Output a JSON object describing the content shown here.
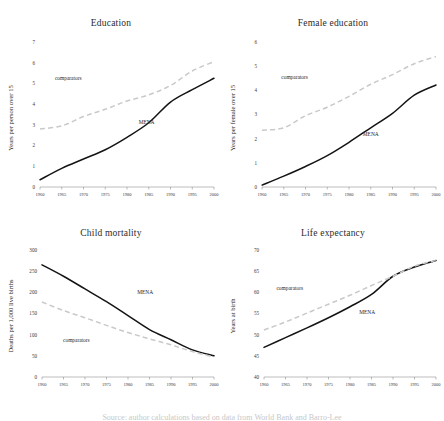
{
  "figure": {
    "background": "#ffffff",
    "mena_color": "#141414",
    "comparator_color": "#c9c9c9",
    "caption": "Source: author calculations based on data from World Bank and Barro-Lee"
  },
  "series_labels": {
    "mena": "MENA",
    "comparators": "comparators"
  },
  "chart_data": [
    {
      "type": "line",
      "title": "Education",
      "xlabel": "",
      "ylabel": "Years per person over 15",
      "x": [
        1960,
        1965,
        1970,
        1975,
        1980,
        1985,
        1990,
        1995,
        2000
      ],
      "xlim": [
        1960,
        2000
      ],
      "ylim": [
        0,
        7
      ],
      "yticks": [
        0,
        1,
        2,
        3,
        4,
        5,
        6,
        7
      ],
      "xticks": [
        "1960",
        "1965",
        "1970",
        "1975",
        "1980",
        "1985",
        "1990",
        "1995",
        "2000"
      ],
      "grid": false,
      "legend": "in-plot labels",
      "series": [
        {
          "name": "MENA",
          "values": [
            0.35,
            0.9,
            1.35,
            1.8,
            2.4,
            3.1,
            4.1,
            4.7,
            5.25
          ]
        },
        {
          "name": "comparators",
          "values": [
            2.8,
            2.95,
            3.4,
            3.75,
            4.15,
            4.45,
            4.9,
            5.6,
            6.05
          ]
        }
      ]
    },
    {
      "type": "line",
      "title": "Female education",
      "xlabel": "",
      "ylabel": "Years per female over 15",
      "x": [
        1960,
        1965,
        1970,
        1975,
        1980,
        1985,
        1990,
        1995,
        2000
      ],
      "xlim": [
        1960,
        2000
      ],
      "ylim": [
        0,
        6
      ],
      "yticks": [
        0,
        1,
        2,
        3,
        4,
        5,
        6
      ],
      "xticks": [
        "1960",
        "1965",
        "1970",
        "1975",
        "1980",
        "1985",
        "1990",
        "1995",
        "2000"
      ],
      "grid": false,
      "legend": "in-plot labels",
      "series": [
        {
          "name": "MENA",
          "values": [
            0.08,
            0.45,
            0.85,
            1.3,
            1.85,
            2.45,
            3.05,
            3.8,
            4.22
          ]
        },
        {
          "name": "comparators",
          "values": [
            2.35,
            2.45,
            2.95,
            3.3,
            3.75,
            4.25,
            4.65,
            5.1,
            5.4
          ]
        }
      ]
    },
    {
      "type": "line",
      "title": "Child mortality",
      "xlabel": "",
      "ylabel": "Deaths per 1,000 live births",
      "x": [
        1960,
        1965,
        1970,
        1975,
        1980,
        1985,
        1990,
        1995,
        2000
      ],
      "xlim": [
        1960,
        2000
      ],
      "ylim": [
        0,
        300
      ],
      "yticks": [
        0,
        50,
        100,
        150,
        200,
        250,
        300
      ],
      "xticks": [
        "1960",
        "1965",
        "1970",
        "1975",
        "1980",
        "1985",
        "1990",
        "1995",
        "2000"
      ],
      "grid": false,
      "legend": "in-plot labels",
      "series": [
        {
          "name": "MENA",
          "values": [
            265,
            238,
            208,
            178,
            145,
            112,
            88,
            64,
            50
          ]
        },
        {
          "name": "comparators",
          "values": [
            177,
            157,
            140,
            122,
            105,
            90,
            76,
            60,
            47
          ]
        }
      ]
    },
    {
      "type": "line",
      "title": "Life expectancy",
      "xlabel": "",
      "ylabel": "Years at birth",
      "x": [
        1960,
        1965,
        1970,
        1975,
        1980,
        1985,
        1990,
        1995,
        2000
      ],
      "xlim": [
        1960,
        2000
      ],
      "ylim": [
        40,
        70
      ],
      "yticks": [
        40,
        45,
        50,
        55,
        60,
        65,
        70
      ],
      "xticks": [
        "1960",
        "1965",
        "1970",
        "1975",
        "1980",
        "1985",
        "1990",
        "1995",
        "2000"
      ],
      "grid": false,
      "legend": "in-plot labels",
      "series": [
        {
          "name": "MENA",
          "values": [
            47.0,
            49.3,
            51.6,
            54.0,
            56.6,
            59.5,
            63.8,
            66.0,
            67.5
          ]
        },
        {
          "name": "comparators",
          "values": [
            51.1,
            53.0,
            55.1,
            57.2,
            59.3,
            61.6,
            63.8,
            66.2,
            67.5
          ]
        }
      ]
    }
  ],
  "label_positions": [
    {
      "comparators": {
        "x": 1966.5,
        "y": 5.15
      },
      "mena": {
        "x": 1984.5,
        "y": 3.05
      }
    },
    {
      "comparators": {
        "x": 1967.5,
        "y": 4.45
      },
      "mena": {
        "x": 1985.0,
        "y": 2.1
      }
    },
    {
      "comparators": {
        "x": 1968.0,
        "y": 82
      },
      "mena": {
        "x": 1984.0,
        "y": 196
      }
    },
    {
      "comparators": {
        "x": 1966.0,
        "y": 60.6
      },
      "mena": {
        "x": 1984.0,
        "y": 55.0
      }
    }
  ]
}
